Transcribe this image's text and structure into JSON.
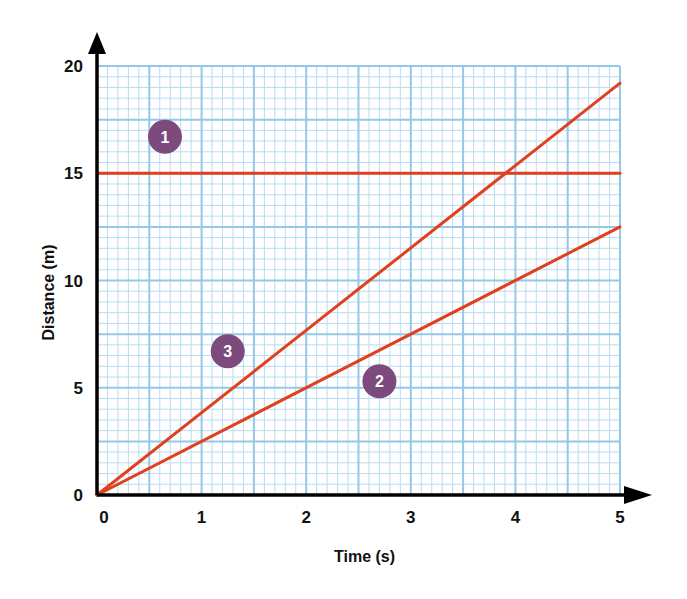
{
  "chart_data": {
    "type": "line",
    "title": "",
    "xlabel": "Time (s)",
    "ylabel": "Distance (m)",
    "xlim": [
      0,
      5
    ],
    "ylim": [
      0,
      20
    ],
    "x_ticks": [
      "0",
      "1",
      "2",
      "3",
      "4",
      "5"
    ],
    "y_ticks": [
      "0",
      "5",
      "10",
      "15",
      "20"
    ],
    "grid": true,
    "grid_style": "graph paper: major lines every 0.5 s and 2.5 m, minor every 0.1 s and 0.5 m",
    "legend": "none (numbered circle markers on lines)",
    "series": [
      {
        "name": "1",
        "label_position": [
          0.65,
          16.7
        ],
        "x": [
          0,
          5
        ],
        "y": [
          15,
          15
        ]
      },
      {
        "name": "2",
        "label_position": [
          2.7,
          5.3
        ],
        "x": [
          0,
          5
        ],
        "y": [
          0,
          12.5
        ]
      },
      {
        "name": "3",
        "label_position": [
          1.25,
          6.7
        ],
        "x": [
          0,
          5
        ],
        "y": [
          0,
          19.2
        ]
      }
    ],
    "colors": {
      "line": "#e0401e",
      "marker": "#7d4a7e",
      "grid_major": "#93c8e8",
      "grid_minor": "#b9dcf2",
      "axis": "#000000"
    }
  }
}
